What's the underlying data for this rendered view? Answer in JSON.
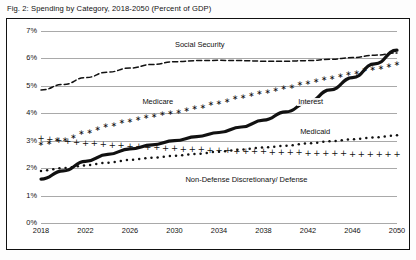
{
  "caption": "Fig. 2: Spending by Category, 2018-2050 (Percent of GDP)",
  "axis": {
    "y_ticks": [
      "0%",
      "1%",
      "2%",
      "3%",
      "4%",
      "5%",
      "6%",
      "7%"
    ],
    "x_ticks": [
      "2018",
      "2022",
      "2026",
      "2030",
      "2034",
      "2038",
      "2042",
      "2046",
      "2050"
    ]
  },
  "series_labels": {
    "social_security": "Social Security",
    "medicare": "Medicare",
    "interest": "Interest",
    "medicaid": "Medicaid",
    "nondefense": "Non-Defense Discretionary/ Defense"
  },
  "colors": {
    "ink": "#111111",
    "grid": "#a9a9a9",
    "frame": "#111111",
    "background": "#ffffff"
  },
  "chart_data": {
    "type": "line",
    "title": "Fig. 2: Spending by Category, 2018-2050 (Percent of GDP)",
    "xlabel": "",
    "ylabel": "Percent of GDP",
    "xlim": [
      2018,
      2050
    ],
    "ylim": [
      0,
      7
    ],
    "grid": true,
    "legend": "inline-annotations",
    "x": [
      2018,
      2020,
      2022,
      2024,
      2026,
      2028,
      2030,
      2032,
      2034,
      2036,
      2038,
      2040,
      2042,
      2044,
      2046,
      2048,
      2050
    ],
    "series": [
      {
        "name": "Social Security",
        "style": "dashed",
        "values": [
          4.85,
          5.05,
          5.3,
          5.5,
          5.65,
          5.78,
          5.88,
          5.92,
          5.93,
          5.92,
          5.9,
          5.9,
          5.92,
          5.97,
          6.03,
          6.12,
          6.2
        ]
      },
      {
        "name": "Medicare",
        "style": "star-markers",
        "values": [
          2.9,
          3.05,
          3.3,
          3.55,
          3.75,
          3.92,
          4.05,
          4.2,
          4.4,
          4.6,
          4.78,
          4.95,
          5.12,
          5.3,
          5.48,
          5.65,
          5.8
        ]
      },
      {
        "name": "Interest",
        "style": "thick-solid",
        "values": [
          1.6,
          1.9,
          2.25,
          2.5,
          2.7,
          2.85,
          3.0,
          3.15,
          3.3,
          3.5,
          3.75,
          4.05,
          4.4,
          4.85,
          5.3,
          5.8,
          6.3
        ]
      },
      {
        "name": "Medicaid",
        "style": "dotted",
        "values": [
          1.9,
          2.0,
          2.1,
          2.2,
          2.3,
          2.38,
          2.45,
          2.52,
          2.6,
          2.68,
          2.75,
          2.82,
          2.9,
          2.98,
          3.05,
          3.12,
          3.2
        ]
      },
      {
        "name": "Non-Defense Discretionary/ Defense",
        "style": "plus-markers",
        "values": [
          3.1,
          3.0,
          2.92,
          2.86,
          2.8,
          2.76,
          2.72,
          2.68,
          2.65,
          2.62,
          2.6,
          2.58,
          2.56,
          2.54,
          2.52,
          2.51,
          2.5
        ]
      }
    ]
  }
}
